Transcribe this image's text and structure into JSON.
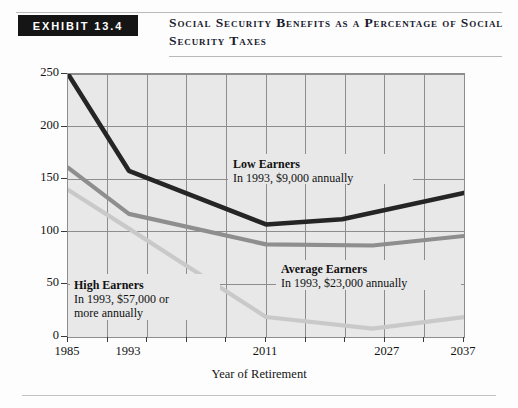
{
  "header": {
    "exhibit_label": "EXHIBIT 13.4",
    "title": "Social Security Benefits as a Percentage of Social Security Taxes"
  },
  "chart_data": {
    "type": "line",
    "title": "Social Security Benefits as a Percentage of Social Security Taxes",
    "xlabel": "Year of Retirement",
    "ylabel": "",
    "xlim": [
      1985,
      2037
    ],
    "ylim": [
      0,
      250
    ],
    "yticks": [
      0,
      50,
      100,
      150,
      200,
      250
    ],
    "xticks": [
      1985,
      1993,
      2011,
      2027,
      2037
    ],
    "xtick_labels": [
      "1985",
      "1993",
      "2011",
      "2027",
      "2037"
    ],
    "ytick_labels": [
      "0",
      "50",
      "100",
      "150",
      "200",
      "250"
    ],
    "grid": true,
    "legend_position": "inline-annotations",
    "series": [
      {
        "name": "Low Earners",
        "sublabel": "In 1993, $9,000 annually",
        "color": "#252525",
        "x": [
          1985,
          1993,
          2011,
          2021,
          2037
        ],
        "values": [
          250,
          158,
          107,
          112,
          137
        ]
      },
      {
        "name": "Average Earners",
        "sublabel": "In 1993, $23,000 annually",
        "color": "#8e8e8e",
        "x": [
          1985,
          1993,
          2011,
          2025,
          2037
        ],
        "values": [
          161,
          117,
          88,
          87,
          96
        ]
      },
      {
        "name": "High Earners",
        "sublabel": "In 1993, $57,000 or more annually",
        "color": "#c9c9c9",
        "x": [
          1985,
          1993,
          2011,
          2025,
          2037
        ],
        "values": [
          140,
          103,
          19,
          8,
          19
        ]
      }
    ]
  },
  "colors": {
    "plot_background": "#e8e8e8",
    "gridline": "#8d8d8d",
    "exhibit_box": "#151515",
    "low_earners": "#252525",
    "average_earners": "#8e8e8e",
    "high_earners": "#c9c9c9"
  }
}
